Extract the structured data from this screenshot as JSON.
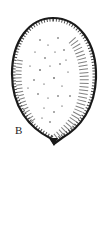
{
  "figure": {
    "panel_label": "B",
    "ink_color": "#1a1a1a",
    "background": "#ffffff"
  }
}
